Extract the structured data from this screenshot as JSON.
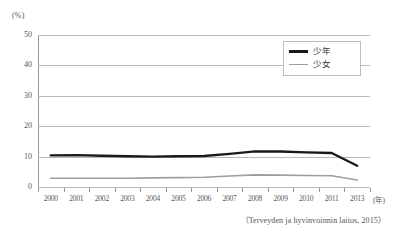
{
  "chart_data": {
    "type": "line",
    "title": "",
    "xlabel": "年",
    "ylabel": "(%)",
    "ylim": [
      0,
      50
    ],
    "ytick_values": [
      50,
      40,
      30,
      20,
      10,
      0
    ],
    "grid": true,
    "legend_position": "top-right",
    "categories": [
      "2000",
      "2001",
      "2002",
      "2003",
      "2004",
      "2005",
      "2006",
      "2007",
      "2008",
      "2009",
      "2010",
      "2011",
      "2013"
    ],
    "series": [
      {
        "name": "少年",
        "color": "#1a1a1a",
        "values": [
          10.4,
          10.5,
          10.3,
          10.1,
          10.0,
          10.1,
          10.2,
          10.9,
          11.7,
          11.7,
          11.4,
          11.2,
          7.0
        ]
      },
      {
        "name": "少女",
        "color": "#9e9e9e",
        "values": [
          2.9,
          2.9,
          2.9,
          2.9,
          3.0,
          3.1,
          3.2,
          3.6,
          4.0,
          3.9,
          3.8,
          3.7,
          2.3
        ]
      }
    ],
    "source_note": "（Terveyden ja hyvinvoinnin laitos, 2015）"
  },
  "axis": {
    "unit_label": "(%)",
    "x_unit_label": "(年)"
  },
  "legend": {
    "items": [
      {
        "label": "少年"
      },
      {
        "label": "少女"
      }
    ]
  }
}
